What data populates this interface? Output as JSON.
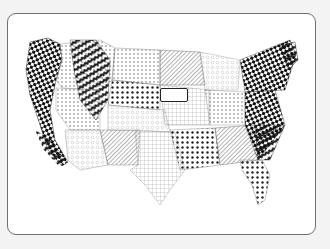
{
  "artwork": {
    "subject": "Zentangle-patterned map of the contiguous United States",
    "colors": {
      "background": "#f3f3f3",
      "card": "#ffffff",
      "card_border": "#6f6f6f",
      "ink": "#111111"
    },
    "label_text": ""
  }
}
